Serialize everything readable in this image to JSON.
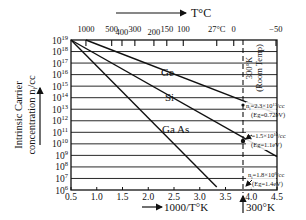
{
  "chart_data": {
    "type": "line",
    "title": "",
    "xlabel": "1000/T°K",
    "ylabel": "Intrinsic Carrier concentration n_i/cc",
    "top_axis_label": "T°C",
    "x_ticks": [
      "0.5",
      "1.0",
      "1.5",
      "2.0",
      "2.5",
      "3.0",
      "3.5",
      "4.0",
      "4.5"
    ],
    "x_tick_values": [
      0.5,
      1.0,
      1.5,
      2.0,
      2.5,
      3.0,
      3.5,
      4.0,
      4.5
    ],
    "top_ticks": [
      {
        "label": "1000",
        "x": 0.79
      },
      {
        "label": "500",
        "x": 1.29
      },
      {
        "label": "400",
        "x": 1.49
      },
      {
        "label": "300",
        "x": 1.74
      },
      {
        "label": "200",
        "x": 2.11
      },
      {
        "label": "150",
        "x": 2.36
      },
      {
        "label": "100",
        "x": 2.68
      },
      {
        "label": "27°C",
        "x": 3.33
      },
      {
        "label": "0",
        "x": 3.66
      },
      {
        "label": "−50",
        "x": 4.48
      }
    ],
    "y_tick_exponents": [
      19,
      18,
      17,
      16,
      15,
      14,
      13,
      12,
      11,
      10,
      9,
      8,
      7,
      6
    ],
    "y_scale": "log10",
    "xlim": [
      0.5,
      4.5
    ],
    "ylim_log10": [
      6,
      19
    ],
    "grid": "horizontal",
    "series": [
      {
        "name": "Ge",
        "points": [
          [
            0.79,
            19
          ],
          [
            4.5,
            12.6
          ]
        ],
        "label_at": [
          2.5,
          15.9
        ],
        "at_300K": "n_i=2.3×10^13/cc",
        "eg": "(Eg=0.72eV)"
      },
      {
        "name": "Si",
        "points": [
          [
            0.5,
            19
          ],
          [
            4.5,
            8.9
          ]
        ],
        "label_at": [
          2.5,
          14.0
        ],
        "at_300K": "n_i=1.5×10^10/cc",
        "eg": "(Eg=1.1eV)"
      },
      {
        "name": "Ga As",
        "points": [
          [
            0.5,
            19
          ],
          [
            3.33,
            6.25
          ]
        ],
        "label_at": [
          2.5,
          11.0
        ],
        "at_300K": "n_i=1.8×10^6/cc",
        "eg": "(Eg=1.4eV)"
      }
    ],
    "annotations": [
      {
        "text": "300°K (Room Temp)",
        "x": 3.33,
        "style": "dashed vertical line"
      },
      {
        "text": "300°K",
        "position": "below x-axis at 3.33"
      }
    ]
  },
  "labels": {
    "top_axis": "T°C",
    "bottom_axis": "1000/T°K",
    "bottom_marker": "300°K",
    "ylabel_line1": "Intrinsic Carrier",
    "ylabel_line2": "concentration n",
    "ylabel_sub": "i",
    "ylabel_unit": "/cc",
    "room_temp_1": "300°K",
    "room_temp_2": "(Room Temp)",
    "ge": "Ge",
    "si": "Si",
    "gaas": "Ga As",
    "ge_ni": "n",
    "ge_ni_rest": "=2.3×10",
    "ge_exp": "13",
    "ge_cc": "/cc",
    "ge_eg": "(Eg=0.72eV)",
    "si_ni_rest": "=1.5×10",
    "si_exp": "10",
    "si_cc": "/cc",
    "si_eg": "(Eg=1.1eV)",
    "gaas_ni_rest": "=1.8×10",
    "gaas_exp": "6",
    "gaas_cc": "/cc",
    "gaas_eg": "(Eg=1.4eV)",
    "ten": "10",
    "sub_i": "i"
  }
}
